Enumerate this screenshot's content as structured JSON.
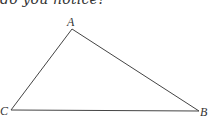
{
  "caption": "do you notice?",
  "diagram": {
    "type": "triangle",
    "stroke_color": "#444444",
    "vertices": [
      {
        "name": "A",
        "x": 72,
        "y": 29,
        "label_x": 67,
        "label_y": 26
      },
      {
        "name": "C",
        "x": 11,
        "y": 110,
        "label_x": 0,
        "label_y": 115
      },
      {
        "name": "B",
        "x": 199,
        "y": 111,
        "label_x": 200,
        "label_y": 116
      }
    ],
    "labels": {
      "A": "A",
      "B": "B",
      "C": "C"
    }
  }
}
